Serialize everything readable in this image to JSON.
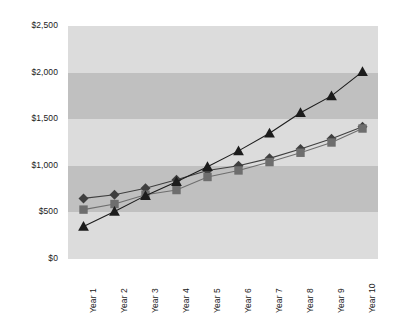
{
  "chart_data": {
    "type": "line",
    "title": "",
    "xlabel": "",
    "ylabel": "",
    "categories": [
      "Year 1",
      "Year 2",
      "Year 3",
      "Year 4",
      "Year 5",
      "Year 6",
      "Year 7",
      "Year 8",
      "Year 9",
      "Year 10"
    ],
    "ytick_labels": [
      "$0",
      "$500",
      "$1,000",
      "$1,500",
      "$2,000",
      "$2,500"
    ],
    "ytick_values": [
      0,
      500,
      1000,
      1500,
      2000,
      2500
    ],
    "ylim": [
      0,
      2500
    ],
    "grid": false,
    "legend": "none",
    "band_shading": true,
    "series": [
      {
        "name": "Series 1",
        "marker": "diamond",
        "color": "#3f3f3f",
        "values": [
          650,
          690,
          760,
          850,
          950,
          1000,
          1080,
          1180,
          1290,
          1420
        ]
      },
      {
        "name": "Series 2",
        "marker": "square",
        "color": "#6e6e6e",
        "values": [
          530,
          590,
          690,
          740,
          880,
          950,
          1040,
          1140,
          1250,
          1400
        ]
      },
      {
        "name": "Series 3",
        "marker": "triangle",
        "color": "#1c1c1c",
        "values": [
          350,
          510,
          680,
          830,
          990,
          1160,
          1350,
          1570,
          1750,
          2010
        ]
      }
    ]
  },
  "colors": {
    "band_light": "#dcdcdc",
    "band_dark": "#c0c0c0",
    "background": "#ffffff",
    "tick_text": "#1a1a1a"
  }
}
